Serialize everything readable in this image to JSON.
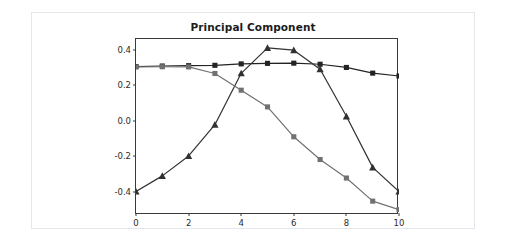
{
  "chart_data": {
    "type": "line",
    "title": "Principal Component",
    "xlabel": "",
    "ylabel": "",
    "x": [
      0,
      1,
      2,
      3,
      4,
      5,
      6,
      7,
      8,
      9,
      10
    ],
    "xlim": [
      0,
      10
    ],
    "ylim": [
      -0.53,
      0.46
    ],
    "xticks": [
      "0",
      "2",
      "4",
      "6",
      "8",
      "10"
    ],
    "xtick_values": [
      0,
      2,
      4,
      6,
      8,
      10
    ],
    "yticks": [
      "0.4",
      "0.2",
      "0.0",
      "-0.2",
      "-0.4"
    ],
    "ytick_values": [
      0.4,
      0.2,
      0.0,
      -0.2,
      -0.4
    ],
    "grid": false,
    "legend": "none",
    "series": [
      {
        "name": "component-1",
        "marker": "square",
        "color": "#232323",
        "values": [
          0.305,
          0.308,
          0.31,
          0.312,
          0.32,
          0.323,
          0.324,
          0.318,
          0.3,
          0.268,
          0.252
        ]
      },
      {
        "name": "component-2",
        "marker": "triangle",
        "color": "#313131",
        "values": [
          -0.398,
          -0.31,
          -0.198,
          -0.022,
          0.267,
          0.41,
          0.397,
          0.29,
          0.025,
          -0.262,
          -0.398
        ]
      },
      {
        "name": "component-3",
        "marker": "square",
        "color": "#717171",
        "values": [
          0.303,
          0.304,
          0.303,
          0.266,
          0.172,
          0.078,
          -0.09,
          -0.218,
          -0.322,
          -0.452,
          -0.5
        ]
      }
    ]
  },
  "figure": {
    "background_color": "#ffffff",
    "border_color": "#e3e6ea",
    "axis_color": "#3a3a3a"
  }
}
